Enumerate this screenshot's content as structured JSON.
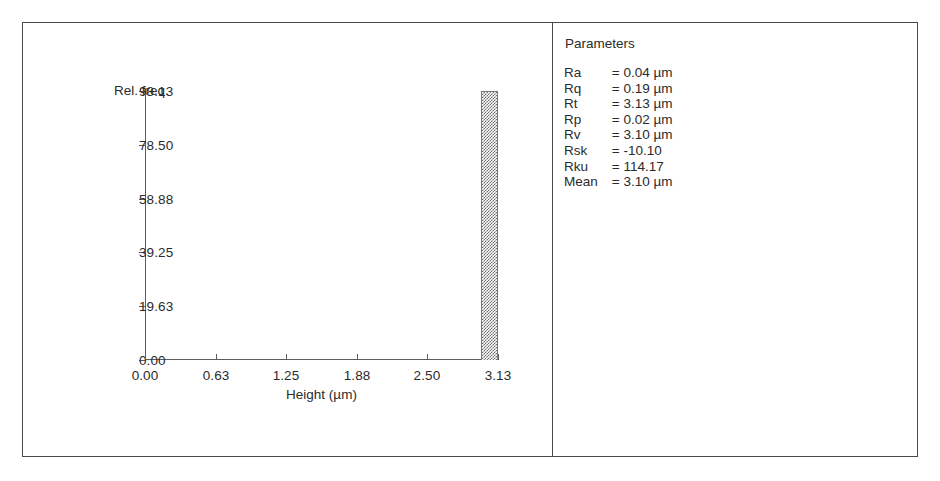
{
  "chart_data": {
    "type": "bar",
    "title": "",
    "xlabel": "Height (µm)",
    "ylabel": "Rel. freq.",
    "xlim": [
      0.0,
      3.13
    ],
    "ylim": [
      0.0,
      98.13
    ],
    "grid": false,
    "legend": "none",
    "xticklabels": [
      "0.00",
      "0.63",
      "1.25",
      "1.88",
      "2.50",
      "3.13"
    ],
    "xtickvalues": [
      0.0,
      0.63,
      1.25,
      1.88,
      2.5,
      3.13
    ],
    "yticklabels": [
      "0.00",
      "19.63",
      "39.25",
      "58.88",
      "78.50",
      "98.13"
    ],
    "ytickvalues": [
      0.0,
      19.63,
      39.25,
      58.88,
      78.5,
      98.13
    ],
    "bars": [
      {
        "x_left": 2.975,
        "x_right": 3.13,
        "value": 98.13
      }
    ],
    "bar_fill": "dithered-gray-checkerboard",
    "bar_color": "#6f6f6f"
  },
  "chart_panel": {
    "y_axis_title": "Rel. freq.",
    "x_axis_title": "Height (µm)"
  },
  "parameters_panel": {
    "title": "Parameters",
    "rows": [
      {
        "name": "Ra",
        "eq": "=",
        "value": "0.04",
        "unit": "µm"
      },
      {
        "name": "Rq",
        "eq": "=",
        "value": "0.19",
        "unit": "µm"
      },
      {
        "name": "Rt",
        "eq": "=",
        "value": "3.13",
        "unit": "µm"
      },
      {
        "name": "Rp",
        "eq": "=",
        "value": "0.02",
        "unit": "µm"
      },
      {
        "name": "Rv",
        "eq": "=",
        "value": "3.10",
        "unit": "µm"
      },
      {
        "name": "Rsk",
        "eq": "=",
        "value": "-10.10",
        "unit": ""
      },
      {
        "name": "Rku",
        "eq": "=",
        "value": "114.17",
        "unit": ""
      },
      {
        "name": "Mean",
        "eq": "=",
        "value": "3.10",
        "unit": "µm"
      }
    ]
  },
  "colors": {
    "frame": "#4a4a4a",
    "axis": "#5d5d5d",
    "text": "#2b2b2b",
    "bar": "#6f6f6f",
    "background": "#ffffff"
  }
}
